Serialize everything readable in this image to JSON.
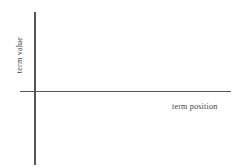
{
  "chart_data": {
    "type": "line",
    "title": "",
    "subtitle": "",
    "xlabel": "term position",
    "ylabel": "term value",
    "series": [],
    "categories": [],
    "values": [],
    "x": [],
    "xticks": [],
    "yticks": [],
    "xticklabels": [],
    "yticklabels": [],
    "grid": false,
    "legend": false,
    "legend_position": "none",
    "annotations": [],
    "axis_color": "#555555",
    "background_color": "#ffffff",
    "text_color": "#444444"
  },
  "figure": {
    "y_axis_label": "term value",
    "x_axis_label": "term position"
  }
}
